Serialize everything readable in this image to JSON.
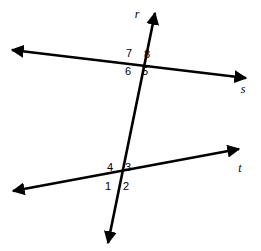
{
  "figure": {
    "type": "geometry-diagram",
    "background_color": "#ffffff",
    "stroke_color": "#000000",
    "width": 261,
    "height": 251
  },
  "lines": [
    {
      "id": "line-r",
      "label": "r",
      "role": "transversal",
      "label_x": 137,
      "label_y": 14,
      "x1": 108,
      "y1": 243,
      "x2": 155,
      "y2": 13,
      "arrow_start": true,
      "arrow_end": true,
      "stroke_width": 2.6
    },
    {
      "id": "line-s",
      "label": "s",
      "role": "parallel-upper",
      "label_x": 243,
      "label_y": 89,
      "x1": 12,
      "y1": 50,
      "x2": 246,
      "y2": 78,
      "arrow_start": true,
      "arrow_end": true,
      "stroke_width": 2.6
    },
    {
      "id": "line-t",
      "label": "t",
      "role": "parallel-lower",
      "label_x": 240,
      "label_y": 168,
      "x1": 13,
      "y1": 191,
      "x2": 239,
      "y2": 149,
      "arrow_start": true,
      "arrow_end": true,
      "stroke_width": 2.6
    }
  ],
  "intersections": [
    {
      "id": "intersection-upper",
      "x": 138,
      "y": 62,
      "lines": [
        "r",
        "s"
      ]
    },
    {
      "id": "intersection-lower",
      "x": 120,
      "y": 177,
      "lines": [
        "r",
        "t"
      ]
    }
  ],
  "angle_labels": [
    {
      "id": "angle-7",
      "text": "7",
      "x": 129,
      "y": 53,
      "intersection": "intersection-upper",
      "quadrant": "upper-left"
    },
    {
      "id": "angle-8",
      "text": "8",
      "x": 147,
      "y": 54,
      "intersection": "intersection-upper",
      "quadrant": "upper-right"
    },
    {
      "id": "angle-6",
      "text": "6",
      "x": 128,
      "y": 71,
      "intersection": "intersection-upper",
      "quadrant": "lower-left"
    },
    {
      "id": "angle-5",
      "text": "5",
      "x": 145,
      "y": 71,
      "intersection": "intersection-upper",
      "quadrant": "lower-right"
    },
    {
      "id": "angle-4",
      "text": "4",
      "x": 110,
      "y": 167,
      "intersection": "intersection-lower",
      "quadrant": "upper-left"
    },
    {
      "id": "angle-3",
      "text": "3",
      "x": 128,
      "y": 167,
      "intersection": "intersection-lower",
      "quadrant": "upper-right"
    },
    {
      "id": "angle-1",
      "text": "1",
      "x": 108,
      "y": 186,
      "intersection": "intersection-lower",
      "quadrant": "lower-left"
    },
    {
      "id": "angle-2",
      "text": "2",
      "x": 126,
      "y": 186,
      "intersection": "intersection-lower",
      "quadrant": "lower-right"
    }
  ]
}
